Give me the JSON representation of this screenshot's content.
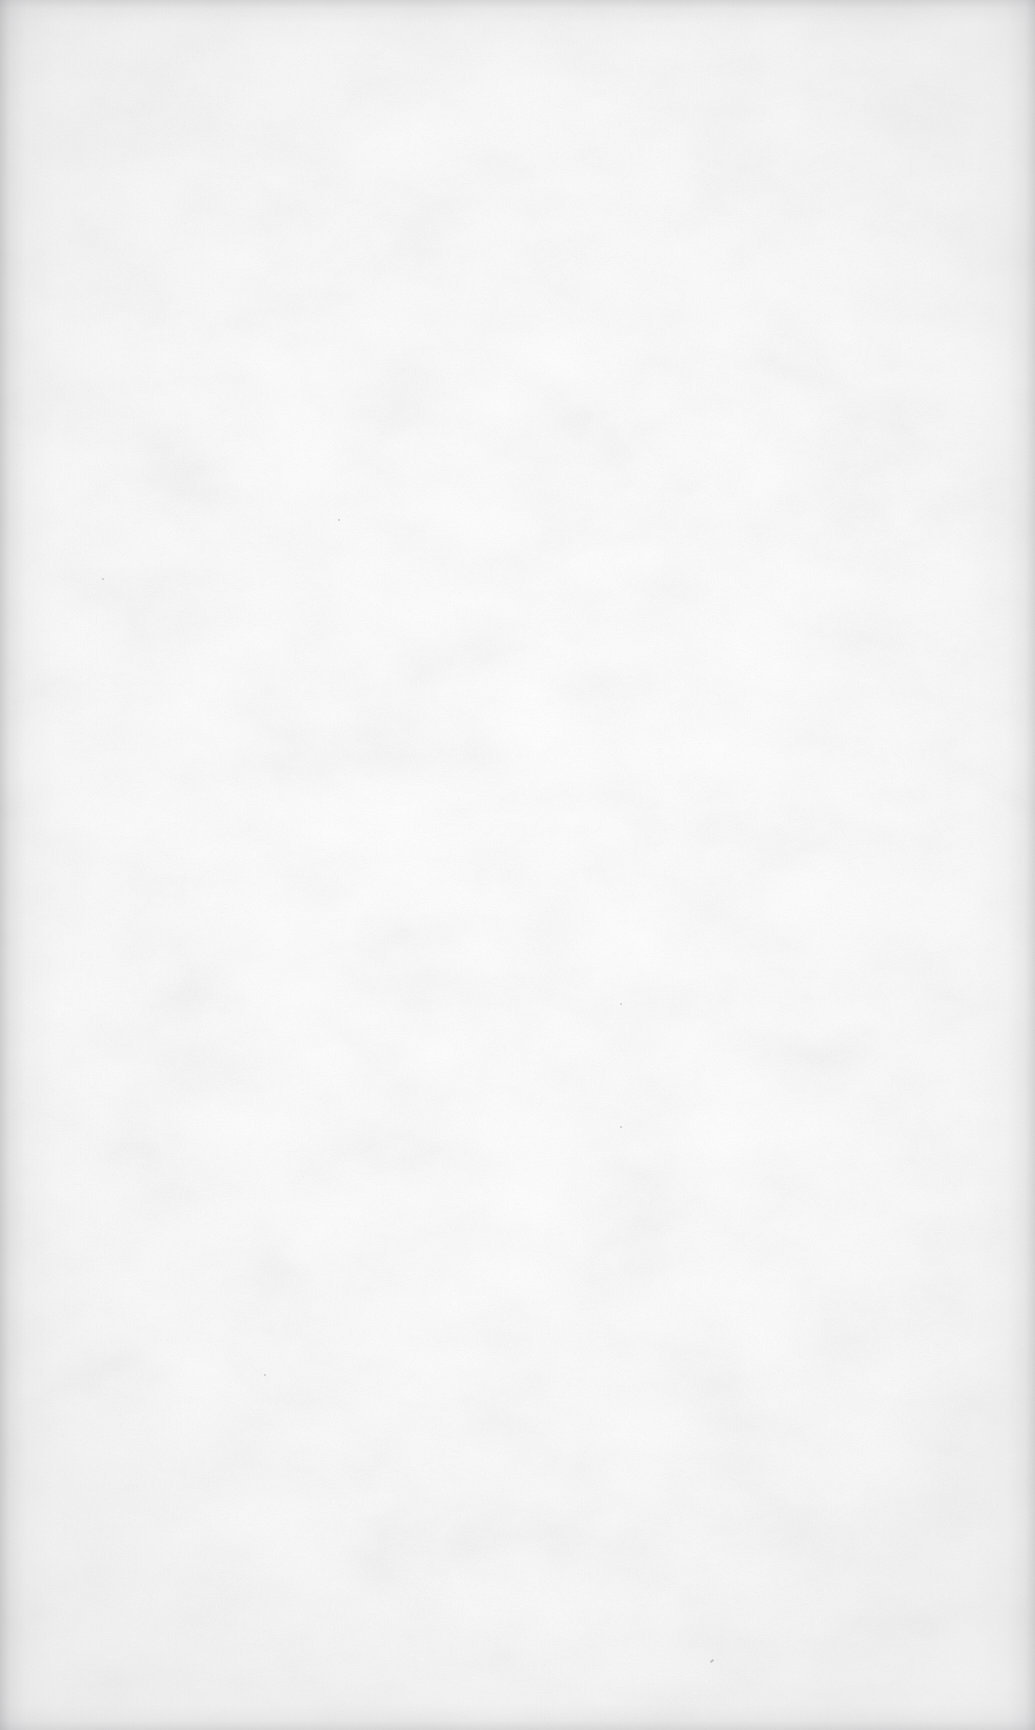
{
  "page": {
    "kind": "scanned-document-page",
    "content_state": "blank",
    "description": "Blank scanned page — no text, figures, rules or page number present",
    "orientation": "portrait",
    "width_px": 1035,
    "height_px": 1730,
    "text_blocks": [],
    "figures": [],
    "tables": [],
    "page_number": "",
    "header": "",
    "footer": ""
  },
  "appearance": {
    "paper_color": "#fdfdfd",
    "center_highlight_color": "#ffffff",
    "edge_shadow_color": "#a8a8aa",
    "grain": "fine paper fibre noise",
    "vignette": "soft gray shadow on all four edges, strongest at left and top"
  },
  "artifacts": [
    {
      "name": "dust-speck",
      "x": 710,
      "y": 1660,
      "size": 4,
      "shape": "fibre"
    },
    {
      "name": "dust-speck",
      "x": 338,
      "y": 519,
      "size": 2,
      "shape": "dot"
    },
    {
      "name": "dust-speck",
      "x": 102,
      "y": 578,
      "size": 2,
      "shape": "dot"
    },
    {
      "name": "dust-speck",
      "x": 620,
      "y": 1003,
      "size": 2,
      "shape": "dot"
    },
    {
      "name": "dust-speck",
      "x": 620,
      "y": 1126,
      "size": 2,
      "shape": "dot"
    },
    {
      "name": "dust-speck",
      "x": 264,
      "y": 1374,
      "size": 2,
      "shape": "dot"
    }
  ]
}
